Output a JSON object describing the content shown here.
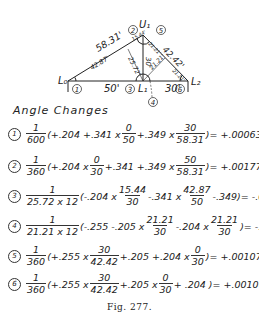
{
  "diagram": {
    "nodes": {
      "L0": "L₀",
      "U1": "U₁",
      "L1": "L₁",
      "L2": "L₂"
    },
    "member_lengths": {
      "L0_U1": "58.31'",
      "U1_L2": "42.42'",
      "U1_L1": "30'",
      "L0_L1": "50'",
      "L1_L2": "30'"
    },
    "perpendicular_distances": {
      "L0_side": "42.87'",
      "L1_to_L0U1": "25.72'",
      "U1_upper": "15.44'",
      "U1_right": "21.21'",
      "L1_right": "21.21'",
      "L2_side": "21.21'"
    },
    "angle_markers": [
      "1",
      "2",
      "3",
      "4",
      "5",
      "6"
    ]
  },
  "heading": "Angle Changes",
  "equations": [
    {
      "id": "1",
      "coef_num": "1",
      "coef_den": "600",
      "body": [
        "(+.204 +.341 x",
        {
          "n": "0",
          "d": "50"
        },
        "+.349 x",
        {
          "n": "30",
          "d": "58.31"
        },
        ")"
      ],
      "result": "= +.000639"
    },
    {
      "id": "2",
      "coef_num": "1",
      "coef_den": "360",
      "body": [
        "(+.204 x",
        {
          "n": "0",
          "d": "30"
        },
        "+.341 +.349 x",
        {
          "n": "50",
          "d": "58.31"
        },
        ")"
      ],
      "result": "= +.001778"
    },
    {
      "id": "3",
      "coef_num": "1",
      "coef_den": "25.72 x 12",
      "body": [
        "(-.204 x",
        {
          "n": "15.44",
          "d": "30"
        },
        "-.341 x",
        {
          "n": "42.87",
          "d": "50"
        },
        "-.349)"
      ],
      "result": "= -.002417"
    },
    {
      "id": "4",
      "coef_num": "1",
      "coef_den": "21.21 x 12",
      "body": [
        "(-.255 -.205 x",
        {
          "n": "21.21",
          "d": "30"
        },
        "-.204 x",
        {
          "n": "21.21",
          "d": "30"
        },
        ")"
      ],
      "result": "= -.002138"
    },
    {
      "id": "5",
      "coef_num": "1",
      "coef_den": "360",
      "body": [
        "(+.255 x",
        {
          "n": "30",
          "d": "42.42"
        },
        "+.205 +.204 x",
        {
          "n": "0",
          "d": "30"
        },
        ")"
      ],
      "result": "= +.001070"
    },
    {
      "id": "6",
      "coef_num": "1",
      "coef_den": "360",
      "body": [
        "(+.255 x",
        {
          "n": "30",
          "d": "42.42"
        },
        "+.205 x",
        {
          "n": "0",
          "d": "30"
        },
        "+ .204 )"
      ],
      "result": "= +.001068"
    }
  ],
  "caption": "Fig. 277."
}
